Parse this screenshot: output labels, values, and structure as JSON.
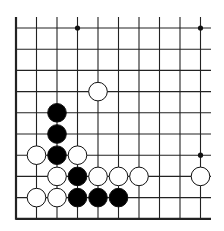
{
  "board": {
    "description": "Go board fragment, bottom-left corner",
    "cols": 10,
    "rows": 10,
    "origin_x": 16,
    "origin_y": 28,
    "spacing_x": 20.5,
    "spacing_y": 21.2,
    "edges": [
      "left",
      "bottom"
    ],
    "line_color": "#222222",
    "star_points": [
      [
        3,
        0
      ],
      [
        9,
        0
      ],
      [
        9,
        6
      ]
    ],
    "stones": [
      {
        "color": "white",
        "col": 4,
        "row": 3
      },
      {
        "color": "black",
        "col": 2,
        "row": 4
      },
      {
        "color": "black",
        "col": 2,
        "row": 5
      },
      {
        "color": "white",
        "col": 1,
        "row": 6
      },
      {
        "color": "black",
        "col": 2,
        "row": 6
      },
      {
        "color": "white",
        "col": 3,
        "row": 6
      },
      {
        "color": "white",
        "col": 2,
        "row": 7
      },
      {
        "color": "black",
        "col": 3,
        "row": 7
      },
      {
        "color": "white",
        "col": 4,
        "row": 7
      },
      {
        "color": "white",
        "col": 5,
        "row": 7
      },
      {
        "color": "white",
        "col": 6,
        "row": 7
      },
      {
        "color": "white",
        "col": 9,
        "row": 7
      },
      {
        "color": "white",
        "col": 1,
        "row": 8
      },
      {
        "color": "white",
        "col": 2,
        "row": 8
      },
      {
        "color": "black",
        "col": 3,
        "row": 8
      },
      {
        "color": "black",
        "col": 4,
        "row": 8
      },
      {
        "color": "black",
        "col": 5,
        "row": 8
      }
    ]
  }
}
